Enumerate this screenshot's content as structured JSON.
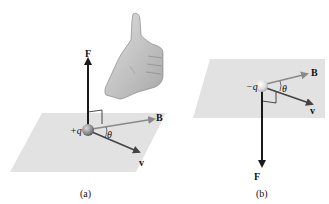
{
  "figure": {
    "panels": [
      {
        "id": "a",
        "caption": "(a)",
        "charge_label": "+q",
        "force_label": "F",
        "field_label": "B",
        "velocity_label": "v",
        "angle_label": "θ",
        "force_direction": "up",
        "has_hand": true,
        "hand_gesture": "right-hand thumbs-up"
      },
      {
        "id": "b",
        "caption": "(b)",
        "charge_label": "−q",
        "force_label": "F",
        "field_label": "B",
        "velocity_label": "v",
        "angle_label": "θ",
        "force_direction": "down",
        "has_hand": false
      }
    ],
    "colors": {
      "plane": "#e2e2e2",
      "arrow_dark": "#1a1a1a",
      "arrow_B": "#8a8a8a",
      "arrow_v": "#444444",
      "sphere_a": "#9a9a9a",
      "sphere_b": "#dcdcdc",
      "hand": "#c8c8c8"
    }
  }
}
